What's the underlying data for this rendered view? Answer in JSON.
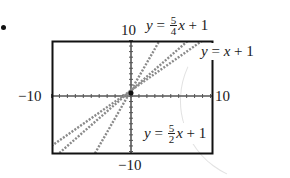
{
  "bullet": "•",
  "labels": {
    "y_max": "10",
    "y_min": "−10",
    "x_min": "−10",
    "x_max": "10"
  },
  "equations": [
    {
      "prefix": "y",
      "eq": " = ",
      "num": "5",
      "den": "4",
      "var": "x",
      "rest": " + 1"
    },
    {
      "prefix": "y",
      "eq": " = ",
      "num": "",
      "den": "",
      "var": "x",
      "rest": " + 1"
    },
    {
      "prefix": "y",
      "eq": " = ",
      "num": "5",
      "den": "2",
      "var": "x",
      "rest": " + 1"
    }
  ],
  "colors": {
    "frame": "#111111",
    "axis": "#555555",
    "line": "#8a8a8a"
  },
  "chart_data": {
    "type": "line",
    "title": "",
    "xlabel": "",
    "ylabel": "",
    "xlim": [
      -10,
      10
    ],
    "ylim": [
      -10,
      10
    ],
    "grid": false,
    "axis_ticks": "unit tick marks on both axes",
    "series": [
      {
        "name": "y = 5/4 x + 1",
        "slope": 1.25,
        "intercept": 1
      },
      {
        "name": "y = x + 1",
        "slope": 1,
        "intercept": 1
      },
      {
        "name": "y = 5/2 x + 1",
        "slope": 2.5,
        "intercept": 1
      }
    ]
  }
}
